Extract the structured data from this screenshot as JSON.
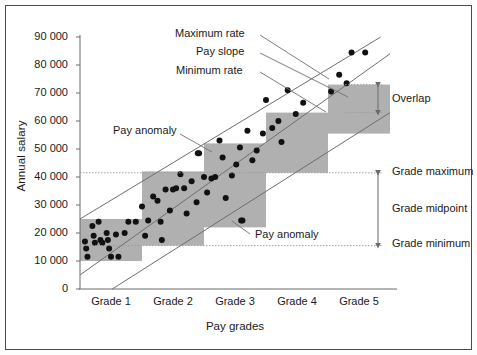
{
  "chart_data": {
    "type": "scatter",
    "title": "",
    "xlabel": "Pay grades",
    "ylabel": "Annual salary",
    "ylim": [
      0,
      90000
    ],
    "yticks": [
      0,
      10000,
      20000,
      30000,
      40000,
      50000,
      60000,
      70000,
      80000,
      90000
    ],
    "ytick_labels": [
      "0",
      "10 000",
      "20 000",
      "30 000",
      "40 000",
      "50 000",
      "60 000",
      "70 000",
      "80 000",
      "90 000"
    ],
    "categories": [
      "Grade 1",
      "Grade 2",
      "Grade 3",
      "Grade 4",
      "Grade 5"
    ],
    "grid": false,
    "legend": "none",
    "grade_bands": [
      {
        "name": "Grade 1",
        "x0": 0,
        "x1": 1,
        "min": 10000,
        "max": 25000
      },
      {
        "name": "Grade 2",
        "x0": 1,
        "x1": 2,
        "min": 15500,
        "max": 42000
      },
      {
        "name": "Grade 3",
        "x0": 2,
        "x1": 3,
        "min": 22000,
        "max": 52000
      },
      {
        "name": "Grade 4",
        "x0": 3,
        "x1": 4,
        "min": 41500,
        "max": 63000
      },
      {
        "name": "Grade 5",
        "x0": 4,
        "x1": 5,
        "min": 55500,
        "max": 73000
      }
    ],
    "band_fill": "#b0b0b0",
    "lines": [
      {
        "name": "Maximum rate",
        "x0": 0.0,
        "y0": 25000,
        "x1": 4.85,
        "y1": 90000
      },
      {
        "name": "Pay slope",
        "x0": 0.0,
        "y0": 5000,
        "x1": 5.0,
        "y1": 84000
      },
      {
        "name": "Minimum rate",
        "x0": 0.52,
        "y0": 0,
        "x1": 5.0,
        "y1": 63000
      }
    ],
    "points": [
      {
        "x": 0.08,
        "y": 17000
      },
      {
        "x": 0.1,
        "y": 14500
      },
      {
        "x": 0.12,
        "y": 11500
      },
      {
        "x": 0.2,
        "y": 22500
      },
      {
        "x": 0.22,
        "y": 19000
      },
      {
        "x": 0.24,
        "y": 16500
      },
      {
        "x": 0.3,
        "y": 24000
      },
      {
        "x": 0.33,
        "y": 17500
      },
      {
        "x": 0.36,
        "y": 16500
      },
      {
        "x": 0.43,
        "y": 20000
      },
      {
        "x": 0.45,
        "y": 17500
      },
      {
        "x": 0.47,
        "y": 14500
      },
      {
        "x": 0.5,
        "y": 11500
      },
      {
        "x": 0.58,
        "y": 19500
      },
      {
        "x": 0.62,
        "y": 11500
      },
      {
        "x": 0.72,
        "y": 20000
      },
      {
        "x": 0.78,
        "y": 24000
      },
      {
        "x": 0.9,
        "y": 24000
      },
      {
        "x": 1.0,
        "y": 29500
      },
      {
        "x": 1.05,
        "y": 19000
      },
      {
        "x": 1.1,
        "y": 24500
      },
      {
        "x": 1.18,
        "y": 33000
      },
      {
        "x": 1.25,
        "y": 31500
      },
      {
        "x": 1.3,
        "y": 24000
      },
      {
        "x": 1.32,
        "y": 17500
      },
      {
        "x": 1.38,
        "y": 35500
      },
      {
        "x": 1.45,
        "y": 28000
      },
      {
        "x": 1.5,
        "y": 35500
      },
      {
        "x": 1.55,
        "y": 36000
      },
      {
        "x": 1.62,
        "y": 41000
      },
      {
        "x": 1.68,
        "y": 36000
      },
      {
        "x": 1.72,
        "y": 27000
      },
      {
        "x": 1.8,
        "y": 38500
      },
      {
        "x": 1.88,
        "y": 31000
      },
      {
        "x": 1.9,
        "y": 48500
      },
      {
        "x": 2.0,
        "y": 40000
      },
      {
        "x": 2.05,
        "y": 34500
      },
      {
        "x": 2.12,
        "y": 39500
      },
      {
        "x": 2.18,
        "y": 40000
      },
      {
        "x": 2.25,
        "y": 53000
      },
      {
        "x": 2.3,
        "y": 47000
      },
      {
        "x": 2.35,
        "y": 32500
      },
      {
        "x": 2.45,
        "y": 40500
      },
      {
        "x": 2.52,
        "y": 44500
      },
      {
        "x": 2.58,
        "y": 50500
      },
      {
        "x": 2.62,
        "y": 24500
      },
      {
        "x": 2.7,
        "y": 56500
      },
      {
        "x": 2.78,
        "y": 46000
      },
      {
        "x": 2.85,
        "y": 49500
      },
      {
        "x": 2.95,
        "y": 55500
      },
      {
        "x": 3.0,
        "y": 67500
      },
      {
        "x": 3.1,
        "y": 57500
      },
      {
        "x": 3.2,
        "y": 60000
      },
      {
        "x": 3.25,
        "y": 52500
      },
      {
        "x": 3.35,
        "y": 71000
      },
      {
        "x": 3.48,
        "y": 62500
      },
      {
        "x": 3.6,
        "y": 66500
      },
      {
        "x": 4.05,
        "y": 70500
      },
      {
        "x": 4.18,
        "y": 76500
      },
      {
        "x": 4.3,
        "y": 73500
      },
      {
        "x": 4.38,
        "y": 84500
      },
      {
        "x": 4.6,
        "y": 84500
      },
      {
        "x": 1.92,
        "y": 48500
      },
      {
        "x": 2.6,
        "y": 24500
      }
    ],
    "point_color": "#111111",
    "point_radius": 3,
    "annotations": [
      {
        "name": "maximum-rate",
        "label": "Maximum rate",
        "tx": 175,
        "ty": 35,
        "lx0": 260,
        "ly0": 35,
        "lx1": 329,
        "ly1": 79
      },
      {
        "name": "pay-slope",
        "label": "Pay slope",
        "tx": 196,
        "ty": 53,
        "lx0": 260,
        "ly0": 53,
        "lx1": 348,
        "ly1": 97
      },
      {
        "name": "minimum-rate",
        "label": "Minimum rate",
        "tx": 176,
        "ty": 72,
        "lx0": 260,
        "ly0": 72,
        "lx1": 326,
        "ly1": 112
      },
      {
        "name": "pay-anomaly-upper",
        "label": "Pay anomaly",
        "tx": 113,
        "ty": 132,
        "lx0": 180,
        "ly0": 134,
        "lx1": 212,
        "ly1": 152
      },
      {
        "name": "pay-anomaly-lower",
        "label": "Pay anomaly",
        "tx": 255,
        "ty": 236,
        "lx0": 250,
        "ly0": 234,
        "lx1": 232,
        "ly1": 221
      }
    ],
    "side_markers": [
      {
        "name": "overlap",
        "label": "Overlap",
        "y_top": 73000,
        "y_bottom": 63000,
        "text_x": 392,
        "text_y": 100
      },
      {
        "name": "grade-maximum",
        "label": "Grade maximum",
        "y": 41500,
        "text_x": 392,
        "text_y": 173
      },
      {
        "name": "grade-midpoint",
        "label": "Grade midpoint",
        "y": 28500,
        "text_x": 392,
        "text_y": 210
      },
      {
        "name": "grade-minimum",
        "label": "Grade minimum",
        "y": 15500,
        "text_x": 392,
        "text_y": 245
      }
    ]
  }
}
